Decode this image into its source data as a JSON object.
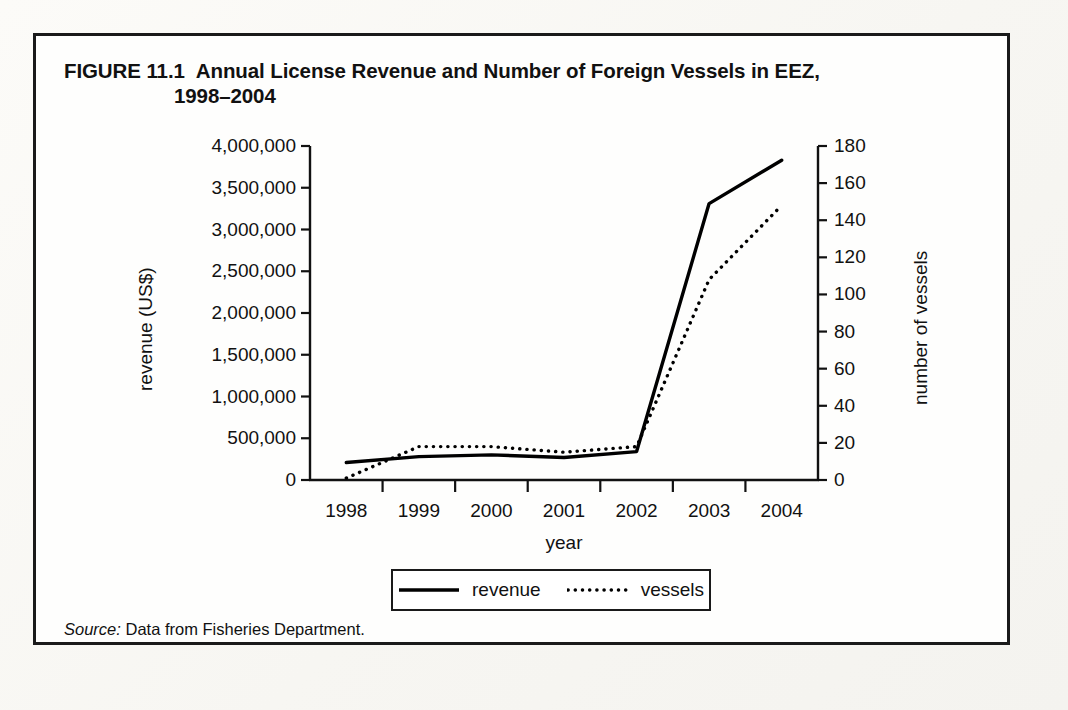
{
  "figure": {
    "number": "FIGURE 11.1",
    "title_line1": "Annual License Revenue and Number of Foreign Vessels in EEZ,",
    "title_line2": "1998–2004",
    "source_word": "Source:",
    "source_text": "Data from Fisheries Department."
  },
  "legend": {
    "revenue_label": "revenue",
    "vessels_label": "vessels"
  },
  "chart_data": {
    "type": "line",
    "xlabel": "year",
    "ylabel": "revenue (US$)",
    "y2label": "number of vessels",
    "categories": [
      "1998",
      "1999",
      "2000",
      "2001",
      "2002",
      "2003",
      "2004"
    ],
    "xticklabels": [
      "1998",
      "1999",
      "2000",
      "2001",
      "2002",
      "2003",
      "2004"
    ],
    "yticklabels": [
      "0",
      "500,000",
      "1,000,000",
      "1,500,000",
      "2,000,000",
      "2,500,000",
      "3,000,000",
      "3,500,000",
      "4,000,000"
    ],
    "ytickvalues": [
      0,
      500000,
      1000000,
      1500000,
      2000000,
      2500000,
      3000000,
      3500000,
      4000000
    ],
    "y2ticklabels": [
      "0",
      "20",
      "40",
      "60",
      "80",
      "100",
      "120",
      "140",
      "160",
      "180"
    ],
    "y2tickvalues": [
      0,
      20,
      40,
      60,
      80,
      100,
      120,
      140,
      160,
      180
    ],
    "ylim": [
      0,
      4000000
    ],
    "y2lim": [
      0,
      180
    ],
    "grid": false,
    "legend_position": "below-center",
    "series": [
      {
        "name": "revenue",
        "axis": "left",
        "style": "solid",
        "color": "#000000",
        "values": [
          210000,
          280000,
          300000,
          270000,
          340000,
          3310000,
          3830000
        ]
      },
      {
        "name": "vessels",
        "axis": "right",
        "style": "dotted",
        "color": "#000000",
        "values": [
          1,
          18,
          18,
          15,
          18,
          108,
          148
        ]
      }
    ]
  }
}
